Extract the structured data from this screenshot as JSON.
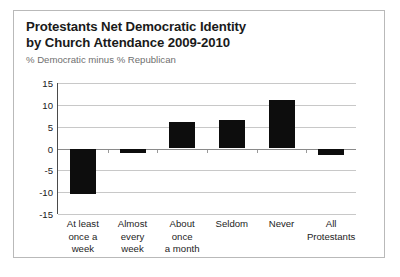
{
  "chart_data": {
    "type": "bar",
    "title": "Protestants Net Democratic Identity by Church Attendance 2009-2010",
    "title_lines": [
      "Protestants Net Democratic Identity",
      "by Church Attendance 2009-2010"
    ],
    "subtitle": "% Democratic minus % Republican",
    "xlabel": "",
    "ylabel": "",
    "ylim": [
      -15,
      15
    ],
    "yticks": [
      15,
      10,
      5,
      0,
      -5,
      -10,
      -15
    ],
    "ytick_labels": [
      "15",
      "10",
      "5",
      "0",
      "-5",
      "-10",
      "-15"
    ],
    "grid": true,
    "legend": "none",
    "bar_color": "#0d0d0d",
    "categories": [
      "At least once a week",
      "Almost every week",
      "About once a month",
      "Seldom",
      "Never",
      "All Protestants"
    ],
    "category_lines": [
      [
        "At least",
        "once a",
        "week"
      ],
      [
        "Almost",
        "every",
        "week"
      ],
      [
        "About",
        "once",
        "a month"
      ],
      [
        "Seldom"
      ],
      [
        "Never"
      ],
      [
        "All",
        "Protestants"
      ]
    ],
    "values": [
      -10.5,
      -1,
      6,
      6.5,
      11,
      -1.5
    ]
  }
}
